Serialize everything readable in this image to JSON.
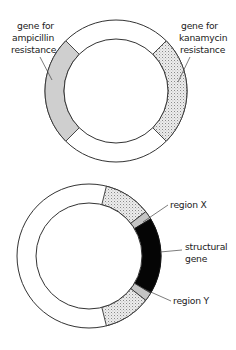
{
  "diagram": {
    "plasmid_top": {
      "center": [
        116,
        91
      ],
      "outer_radius": 71,
      "inner_radius": 52,
      "segments": [
        {
          "name": "ampicillin-resistance-gene",
          "start_deg": 135,
          "end_deg": 225,
          "fill": "grey"
        },
        {
          "name": "kanamycin-resistance-gene",
          "start_deg": -45,
          "end_deg": 45,
          "fill": "stipple"
        }
      ],
      "labels": {
        "ampicillin": {
          "line1": "gene for",
          "line2": "ampicillin",
          "line3": "resistance"
        },
        "kanamycin": {
          "line1": "gene for",
          "line2": "kanamycin",
          "line3": "resistance"
        }
      }
    },
    "plasmid_bottom": {
      "center": [
        89,
        256
      ],
      "outer_radius": 72,
      "inner_radius": 53,
      "segments": [
        {
          "name": "upper-stipple",
          "start_deg": -76,
          "end_deg": -38,
          "fill": "stipple"
        },
        {
          "name": "region-x",
          "start_deg": -38,
          "end_deg": -31,
          "fill": "grey"
        },
        {
          "name": "structural-gene",
          "start_deg": -31,
          "end_deg": 31,
          "fill": "black"
        },
        {
          "name": "region-y",
          "start_deg": 31,
          "end_deg": 38,
          "fill": "grey"
        },
        {
          "name": "lower-stipple",
          "start_deg": 38,
          "end_deg": 76,
          "fill": "stipple"
        }
      ],
      "labels": {
        "region_x": "region X",
        "structural_gene": {
          "line1": "structural",
          "line2": "gene"
        },
        "region_y": "region Y"
      }
    },
    "colors": {
      "stroke": "#333333",
      "grey_fill": "#cfcfcf",
      "stipple_bg": "#ececec",
      "stipple_dot": "#8a8a8a",
      "black_fill": "#050505"
    }
  }
}
